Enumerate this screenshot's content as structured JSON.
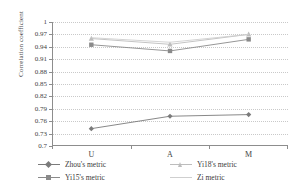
{
  "chart_data": {
    "type": "line",
    "title": "",
    "xlabel": "",
    "ylabel": "Correlation coefficient",
    "categories": [
      "U",
      "A",
      "M"
    ],
    "ylim": [
      0.7,
      1
    ],
    "yticks": [
      "0.7",
      "0.73",
      "0.76",
      "0.79",
      "0.82",
      "0.85",
      "0.88",
      "0.91",
      "0.94",
      "0.97",
      "1"
    ],
    "grid": true,
    "legend_position": "bottom",
    "series": [
      {
        "name": "Zhou's metric",
        "values": [
          0.742,
          0.772,
          0.776
        ],
        "color": "#7b7b7b",
        "marker": "diamond"
      },
      {
        "name": "Yi15's metric",
        "values": [
          0.945,
          0.93,
          0.958
        ],
        "color": "#8a8a8a",
        "marker": "square"
      },
      {
        "name": "Yi18's metric",
        "values": [
          0.96,
          0.946,
          0.97
        ],
        "color": "#bdbdbd",
        "marker": "triangle"
      },
      {
        "name": "Zi metric",
        "values": [
          0.962,
          0.951,
          0.97
        ],
        "color": "#cfcfcf",
        "marker": "none"
      }
    ]
  },
  "legend": {
    "items": [
      {
        "label": "Zhou's metric"
      },
      {
        "label": "Yi18's metric"
      },
      {
        "label": "Yi15's metric"
      },
      {
        "label": "Zi metric"
      }
    ]
  }
}
